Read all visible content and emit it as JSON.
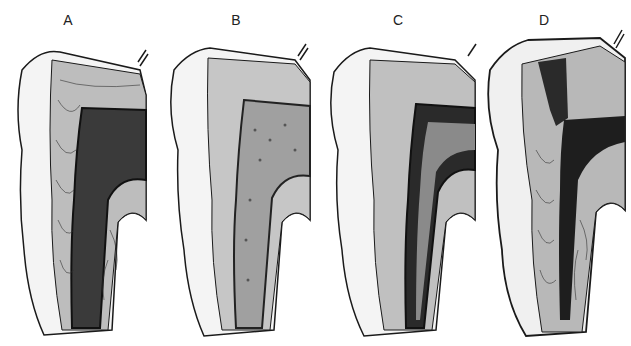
{
  "figure": {
    "panels": [
      {
        "label": "A",
        "pulp": "dense-cellular",
        "pulp_color": "#3a3a3a"
      },
      {
        "label": "B",
        "pulp": "sparse-cellular",
        "pulp_color": "#8a8a8a"
      },
      {
        "label": "C",
        "pulp": "dark-band",
        "pulp_color": "#2a2a2a"
      },
      {
        "label": "D",
        "pulp": "narrowed-dark",
        "pulp_color": "#1e1e1e"
      }
    ],
    "colors": {
      "enamel": "#f4f4f4",
      "dentin": "#bdbdbd",
      "outline": "#1a1a1a",
      "background": "#ffffff"
    }
  }
}
